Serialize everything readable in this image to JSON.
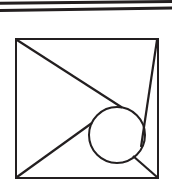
{
  "figure": {
    "background_color": "#ffffff",
    "stroke_color": "#231f20",
    "canvas": {
      "width": 172,
      "height": 191
    },
    "rules": [
      {
        "name": "upper-rule",
        "x1": 0,
        "y1": 3.2,
        "x2": 172,
        "y2": 1.6,
        "width": 3.0
      },
      {
        "name": "lower-rule",
        "x1": 0,
        "y1": 10.4,
        "x2": 172,
        "y2": 8.0,
        "width": 3.0
      }
    ],
    "square": {
      "name": "square-frame",
      "left": 16,
      "top": 39,
      "right": 158,
      "bottom": 178,
      "stroke_width": 2.0,
      "corners": {
        "top_left": [
          16,
          39
        ],
        "top_right": [
          158,
          39
        ],
        "bottom_right": [
          158,
          178
        ],
        "bottom_left": [
          16,
          178
        ]
      }
    },
    "circle": {
      "name": "inscribed-circle",
      "cx": 117,
      "cy": 135,
      "r": 28,
      "stroke_width": 2.0
    },
    "lines": [
      {
        "name": "chord-top-left-to-circle",
        "x1": 17,
        "y1": 40,
        "x2": 122,
        "y2": 107.5,
        "width": 2.2
      },
      {
        "name": "chord-top-right-to-circle",
        "x1": 157,
        "y1": 40,
        "x2": 141,
        "y2": 147,
        "width": 2.2
      },
      {
        "name": "chord-bottom-left-to-circle",
        "x1": 17,
        "y1": 177,
        "x2": 92,
        "y2": 123,
        "width": 2.2
      },
      {
        "name": "chord-bottom-right-to-circle",
        "x1": 157,
        "y1": 177,
        "x2": 133,
        "y2": 156,
        "width": 2.2
      }
    ]
  }
}
